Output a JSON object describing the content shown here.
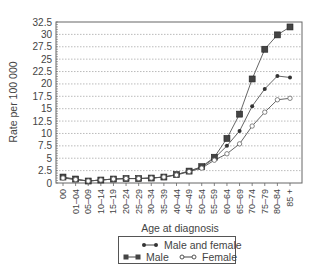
{
  "chart_data": {
    "type": "line",
    "title": "",
    "xlabel": "Age at diagnosis",
    "ylabel": "Rate per 100 000",
    "ylim": [
      0,
      32.5
    ],
    "yticks": [
      0,
      2.5,
      5,
      7.5,
      10,
      12.5,
      15,
      17.5,
      20,
      22.5,
      25,
      27.5,
      30,
      32.5
    ],
    "ytick_labels": [
      "0",
      "2.5",
      "5",
      "7.5",
      "10",
      "12.5",
      "15",
      "17.5",
      "20",
      "22.5",
      "25",
      "27.5",
      "30",
      "32.5"
    ],
    "grid": "horizontal dotted",
    "categories": [
      "00",
      "01–04",
      "05–09",
      "10–14",
      "15–19",
      "20–24",
      "25–29",
      "30–34",
      "35–39",
      "40–44",
      "45–49",
      "50–54",
      "55–59",
      "60–64",
      "65–69",
      "70–74",
      "75–79",
      "80–84",
      "85 +"
    ],
    "series": [
      {
        "name": "Male and female",
        "marker": "dot",
        "values": [
          1.1,
          0.7,
          0.4,
          0.6,
          0.8,
          0.9,
          0.9,
          1.0,
          1.2,
          1.7,
          2.4,
          3.2,
          5.0,
          7.5,
          10.5,
          15.5,
          19.0,
          21.6,
          21.3
        ]
      },
      {
        "name": "Male",
        "marker": "square",
        "values": [
          1.2,
          0.8,
          0.4,
          0.6,
          0.8,
          0.9,
          0.9,
          1.0,
          1.2,
          1.7,
          2.4,
          3.3,
          5.2,
          9.0,
          13.9,
          21.0,
          27.0,
          29.9,
          31.5
        ]
      },
      {
        "name": "Female",
        "marker": "diamond-open",
        "values": [
          1.0,
          0.7,
          0.4,
          0.6,
          0.8,
          0.9,
          0.9,
          1.0,
          1.2,
          1.6,
          2.3,
          3.0,
          4.6,
          5.9,
          7.9,
          11.5,
          14.3,
          16.8,
          17.1
        ]
      }
    ],
    "legend_position": "bottom"
  },
  "legend": {
    "items": [
      {
        "label": "Male and female"
      },
      {
        "label": "Male"
      },
      {
        "label": "Female"
      }
    ]
  }
}
